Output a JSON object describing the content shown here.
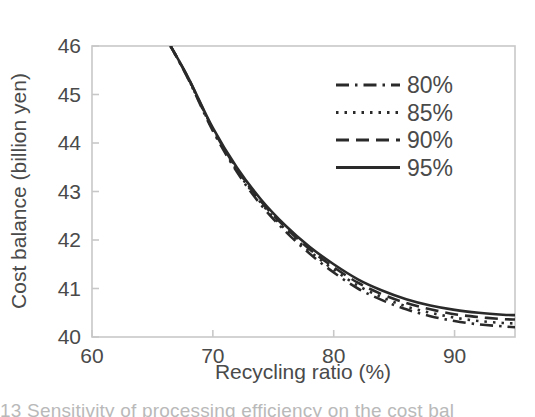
{
  "chart_data": {
    "type": "line",
    "title": "",
    "xlabel": "Recycling ratio (%)",
    "ylabel": "Cost balance (billion yen)",
    "xlim": [
      60,
      95
    ],
    "ylim": [
      40,
      46
    ],
    "xticks": [
      60,
      70,
      80,
      90
    ],
    "yticks": [
      40,
      41,
      42,
      43,
      44,
      45,
      46
    ],
    "grid": false,
    "legend_position": "upper-right",
    "legend_title": "",
    "x": [
      66.5,
      68,
      70,
      72,
      74,
      76,
      78,
      80,
      82,
      84,
      86,
      88,
      90,
      92,
      94,
      95
    ],
    "series": [
      {
        "name": "80%",
        "style": "dashdot",
        "values": [
          46.0,
          45.3,
          44.25,
          43.4,
          42.72,
          42.18,
          41.72,
          41.33,
          41.0,
          40.76,
          40.57,
          40.43,
          40.33,
          40.26,
          40.22,
          40.2
        ]
      },
      {
        "name": "85%",
        "style": "dotted",
        "values": [
          46.0,
          45.31,
          44.27,
          43.43,
          42.76,
          42.22,
          41.77,
          41.39,
          41.06,
          40.82,
          40.63,
          40.5,
          40.4,
          40.33,
          40.29,
          40.28
        ]
      },
      {
        "name": "90%",
        "style": "dashed",
        "values": [
          46.0,
          45.32,
          44.29,
          43.46,
          42.79,
          42.26,
          41.81,
          41.44,
          41.12,
          40.88,
          40.7,
          40.57,
          40.47,
          40.41,
          40.37,
          40.36
        ]
      },
      {
        "name": "95%",
        "style": "solid",
        "values": [
          46.0,
          45.33,
          44.31,
          43.49,
          42.83,
          42.3,
          41.86,
          41.5,
          41.19,
          40.96,
          40.78,
          40.65,
          40.56,
          40.5,
          40.46,
          40.45
        ]
      }
    ],
    "colors": {
      "line": "#2a2a2a",
      "axis": "#c8c8c8",
      "text": "#4a4a4a"
    }
  },
  "caption": {
    "text": "13   Sensitivity of processing efficiency on the cost bal"
  }
}
